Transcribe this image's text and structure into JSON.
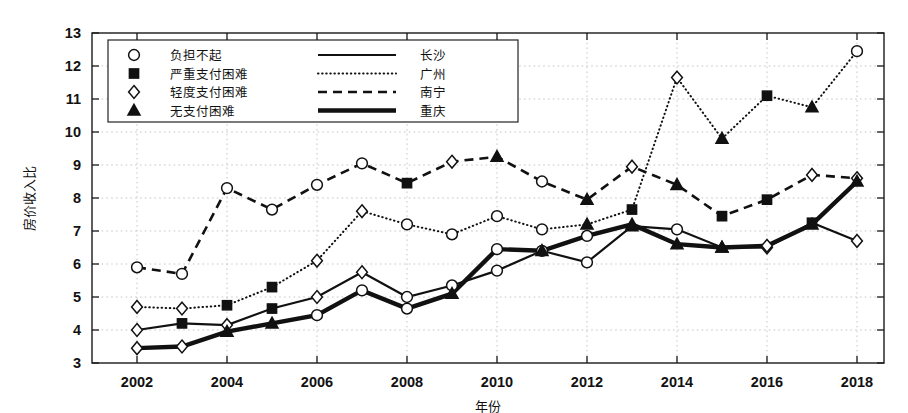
{
  "chart_data": {
    "type": "line",
    "title": "",
    "xlabel": "年份",
    "ylabel": "房价收入比",
    "xlim": [
      2001,
      2018.6
    ],
    "ylim": [
      3,
      13
    ],
    "ytick_labels": [
      "3",
      "4",
      "5",
      "6",
      "7",
      "8",
      "9",
      "10",
      "11",
      "12",
      "13"
    ],
    "xtick_labels": [
      "2002",
      "2004",
      "2006",
      "2008",
      "2010",
      "2012",
      "2014",
      "2016",
      "2018"
    ],
    "grid": true,
    "legend_position": "upper-left",
    "x": [
      2002,
      2003,
      2004,
      2005,
      2006,
      2007,
      2008,
      2009,
      2010,
      2011,
      2012,
      2013,
      2014,
      2015,
      2016,
      2017,
      2018
    ],
    "series": [
      {
        "name": "长沙",
        "line_style": "solid",
        "values": [
          4.0,
          4.2,
          4.15,
          4.65,
          5.0,
          5.75,
          5.0,
          5.35,
          5.8,
          6.4,
          6.05,
          7.15,
          7.05,
          6.5,
          6.5,
          7.25,
          6.7
        ]
      },
      {
        "name": "广州",
        "line_style": "dotted",
        "values": [
          4.7,
          4.65,
          4.75,
          5.3,
          6.1,
          7.6,
          7.2,
          6.9,
          7.45,
          7.05,
          7.2,
          7.65,
          11.65,
          9.8,
          11.1,
          10.75,
          12.45
        ]
      },
      {
        "name": "南宁",
        "line_style": "dashed",
        "values": [
          5.9,
          5.7,
          8.3,
          7.65,
          8.4,
          9.05,
          8.45,
          9.1,
          9.25,
          8.5,
          7.95,
          8.95,
          8.4,
          7.45,
          7.95,
          8.7,
          8.6
        ]
      },
      {
        "name": "重庆",
        "line_style": "thick-solid",
        "values": [
          3.45,
          3.5,
          3.95,
          4.2,
          4.45,
          5.2,
          4.65,
          5.1,
          6.45,
          6.4,
          6.85,
          7.2,
          6.6,
          6.5,
          6.55,
          7.2,
          8.5
        ]
      }
    ],
    "marker_legend": [
      {
        "marker": "circle-open",
        "label": "负担不起"
      },
      {
        "marker": "square-filled",
        "label": "严重支付困难"
      },
      {
        "marker": "diamond-open",
        "label": "轻度支付困难"
      },
      {
        "marker": "triangle-filled",
        "label": "无支付困难"
      }
    ],
    "line_legend": [
      {
        "line_style": "solid",
        "label": "长沙"
      },
      {
        "line_style": "dotted",
        "label": "广州"
      },
      {
        "line_style": "dashed",
        "label": "南宁"
      },
      {
        "line_style": "thick-solid",
        "label": "重庆"
      }
    ],
    "marker_thresholds": {
      "note": "marker per point is chosen by affordability band of the value",
      "bands": [
        {
          "marker": "triangle-filled",
          "max": 6.0
        },
        {
          "marker": "diamond-open",
          "max": 7.0
        },
        {
          "marker": "square-filled",
          "max": 9.0
        },
        {
          "marker": "circle-open",
          "max": 99
        }
      ]
    },
    "point_markers": {
      "长沙": [
        "diamond-open",
        "square-filled",
        "diamond-open",
        "square-filled",
        "diamond-open",
        "diamond-open",
        "circle-open",
        "circle-open",
        "circle-open",
        "circle-open",
        "circle-open",
        "triangle-filled",
        "circle-open",
        "triangle-filled",
        "diamond-open",
        "square-filled",
        "diamond-open"
      ],
      "广州": [
        "diamond-open",
        "diamond-open",
        "square-filled",
        "square-filled",
        "diamond-open",
        "diamond-open",
        "circle-open",
        "circle-open",
        "circle-open",
        "circle-open",
        "triangle-filled",
        "square-filled",
        "diamond-open",
        "triangle-filled",
        "square-filled",
        "triangle-filled",
        "circle-open"
      ],
      "南宁": [
        "circle-open",
        "circle-open",
        "circle-open",
        "circle-open",
        "circle-open",
        "circle-open",
        "square-filled",
        "diamond-open",
        "triangle-filled",
        "circle-open",
        "triangle-filled",
        "diamond-open",
        "triangle-filled",
        "square-filled",
        "square-filled",
        "diamond-open",
        "diamond-open"
      ],
      "重庆": [
        "diamond-open",
        "diamond-open",
        "triangle-filled",
        "triangle-filled",
        "circle-open",
        "circle-open",
        "circle-open",
        "triangle-filled",
        "circle-open",
        "triangle-filled",
        "circle-open",
        "triangle-filled",
        "triangle-filled",
        "triangle-filled",
        "diamond-open",
        "triangle-filled",
        "triangle-filled"
      ]
    },
    "colors": {
      "ink": "#111111",
      "grid": "#b9b9b9",
      "background": "#ffffff"
    }
  }
}
